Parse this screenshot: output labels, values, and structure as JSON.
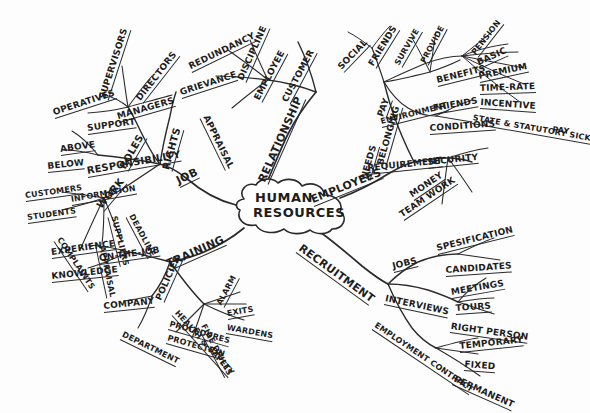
{
  "diagram": {
    "type": "mind-map",
    "title_line_1": "HUMAN",
    "title_line_2": "RESOURCES",
    "ink_color": "#2b2b2b",
    "background_color": "#fdfdfd",
    "main_branches": [
      "JOB",
      "RELATIONSHIP",
      "EMPLOYEES",
      "RECRUITMENT"
    ]
  },
  "labels": {
    "center_1": "HUMAN",
    "center_2": "RESOURCES",
    "job": "JOB",
    "roles": "ROLES",
    "operatives": "OPERATIVES",
    "supervisors": "SUPERVISORS",
    "directors": "DIRECTORS",
    "managers": "MANAGERS",
    "support": "SUPPORT",
    "rights": "RIGHTS",
    "responsibility": "RESPONSIBILITY",
    "above": "ABOVE",
    "below": "BELOW",
    "work": "WORK",
    "information": "INFORMATION",
    "customers": "CUSTOMERS",
    "students": "STUDENTS",
    "suppliers": "SUPPLIERS",
    "deadline": "DEADLINE",
    "complaints": "COMPLAINTS",
    "appraisal_left": "APPRAISAL",
    "training": "TRAINING",
    "on_the_job": "ON-THE-JOB",
    "experience": "EXPERIENCE",
    "knowledge": "KNOWLEDGE",
    "policies": "POLICIES",
    "company": "COMPANY",
    "department": "DEPARTMENT",
    "health_safety": "HEALTH & SAFETY",
    "alarm": "ALARM",
    "exits": "EXITS",
    "wardens": "WARDENS",
    "procedures": "PROCEDURES",
    "protection": "PROTECTION",
    "fire_drills": "FIRE DRILLS",
    "relationship": "RELATIONSHIP",
    "employee": "EMPLOYEE",
    "redundancy": "REDUNDANCY",
    "discipline": "DISCIPLINE",
    "grievance": "GRIEVANCE",
    "appraisal_top": "APPRAISAL",
    "customer": "CUSTOMER",
    "employees": "EMPLOYEES",
    "needs": "NEEDS",
    "belonging": "BELONGING",
    "social": "SOCIAL",
    "friends_top": "FRIENDS",
    "pay": "PAY",
    "pension": "PENSION",
    "basic": "BASIC",
    "premium": "PREMIUM",
    "time_rate": "TIME-RATE",
    "incentive": "INCENTIVE",
    "state_statutory": "STATE & STATUTORY SICK",
    "pay_word": "PAY",
    "benefits": "BENEFITS",
    "survive": "SURVIVE",
    "provide": "PROVIDE",
    "environment": "ENVIRONMENT",
    "friends_env": "FRIENDS",
    "conditions": "CONDITIONS",
    "requirement": "REQUIREMENT",
    "security": "SECURITY",
    "money": "MONEY",
    "team_work": "TEAM WORK",
    "recruitment": "RECRUITMENT",
    "jobs": "JOBS",
    "spesification": "SPESIFICATION",
    "candidates": "CANDIDATES",
    "interviews": "INTERVIEWS",
    "meetings": "MEETINGS",
    "tours": "TOURS",
    "right_person": "RIGHT PERSON",
    "employment_contract": "EMPLOYMENT CONTRACT",
    "temporary": "TEMPORARY",
    "fixed": "FIXED",
    "permanent": "PERMANENT"
  }
}
